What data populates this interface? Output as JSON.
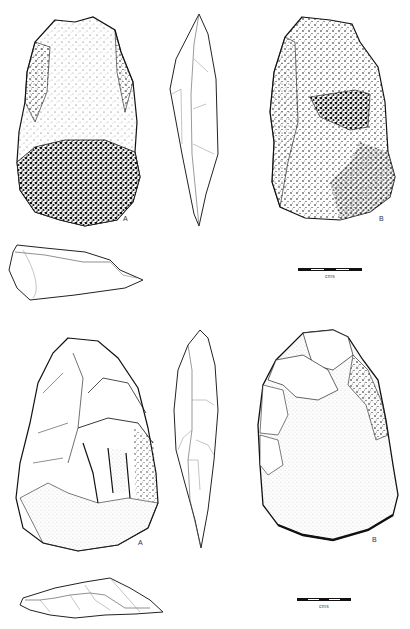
{
  "figure": {
    "artifacts": [
      {
        "id": "artifact-1",
        "views": [
          {
            "name": "face-a",
            "label": "A",
            "texture": "cortex-stipple"
          },
          {
            "name": "lateral-profile",
            "label": "",
            "texture": "outline"
          },
          {
            "name": "face-b",
            "label": "B",
            "texture": "cortex-stipple"
          },
          {
            "name": "plan-section",
            "label": "",
            "texture": "outline"
          }
        ],
        "scale": {
          "label": "cms",
          "segments": 5
        }
      },
      {
        "id": "artifact-2",
        "views": [
          {
            "name": "face-a",
            "label": "A",
            "texture": "flake-scars"
          },
          {
            "name": "lateral-profile",
            "label": "",
            "texture": "outline"
          },
          {
            "name": "face-b",
            "label": "B",
            "texture": "stipple-smooth"
          },
          {
            "name": "plan-section",
            "label": "",
            "texture": "outline"
          }
        ],
        "scale": {
          "label": "cms",
          "segments": 5
        }
      }
    ],
    "colors": {
      "ink": "#111111",
      "paper": "#ffffff",
      "line": "#333333",
      "faint": "#888888"
    }
  }
}
